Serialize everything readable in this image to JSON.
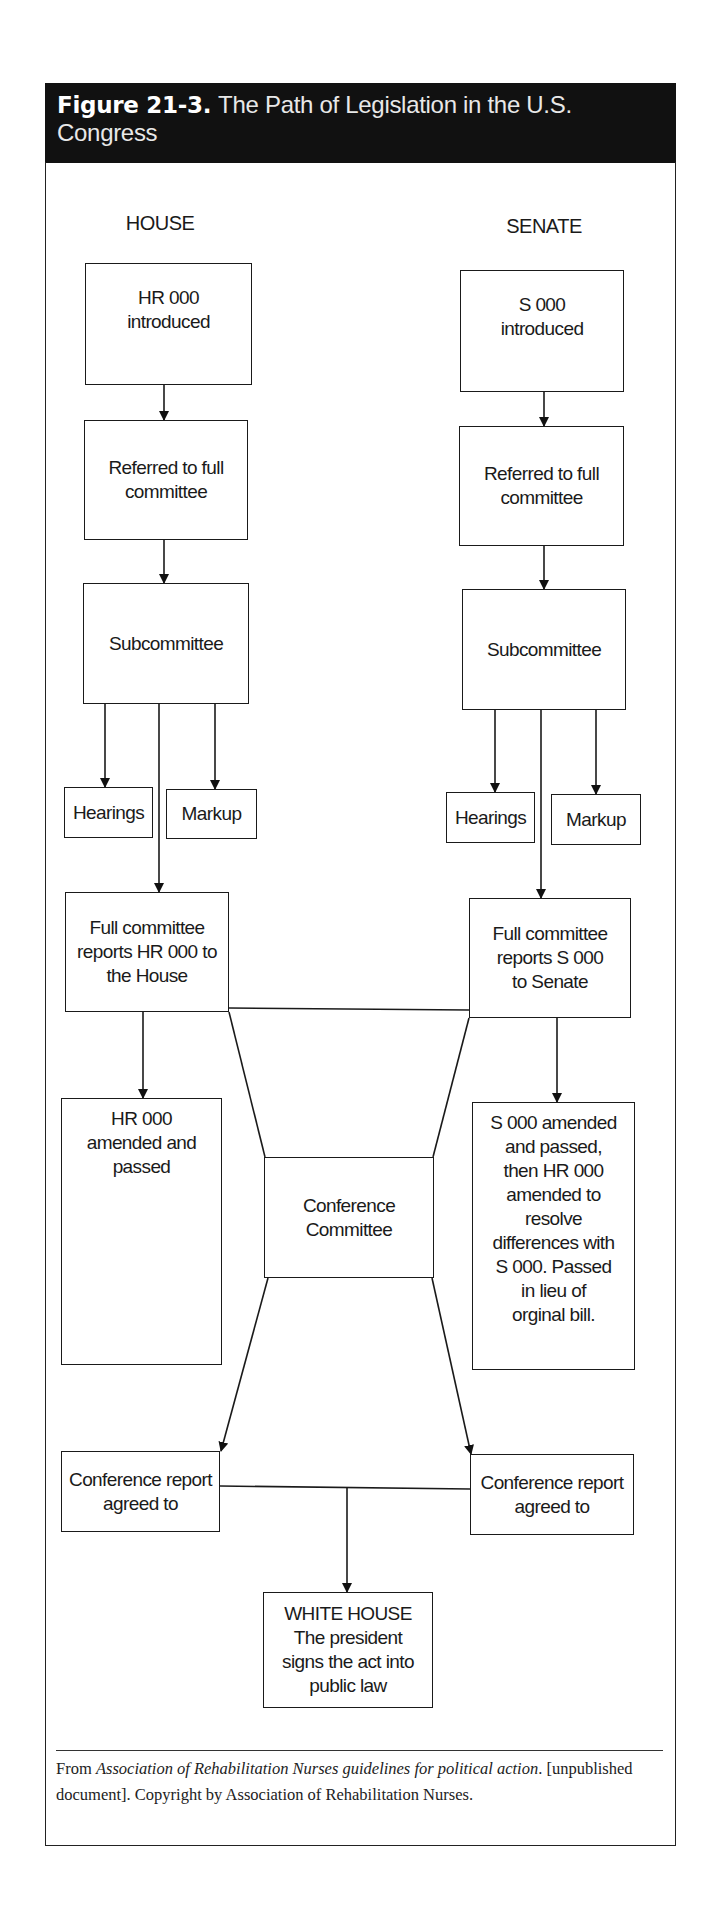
{
  "figure": {
    "number": "Figure 21-3.",
    "title": "The Path of Legislation in the U.S. Congress"
  },
  "chambers": {
    "house": "HOUSE",
    "senate": "SENATE"
  },
  "house": {
    "introduced": "HR 000\nintroduced",
    "referred": "Referred to full\ncommittee",
    "subcommittee": "Subcommittee",
    "hearings": "Hearings",
    "markup": "Markup",
    "full_committee": "Full committee\nreports HR 000 to\nthe House",
    "amended": "HR 000\namended and\npassed",
    "conference_report": "Conference report\nagreed to"
  },
  "senate": {
    "introduced": "S 000\nintroduced",
    "referred": "Referred to full\ncommittee",
    "subcommittee": "Subcommittee",
    "hearings": "Hearings",
    "markup": "Markup",
    "full_committee": "Full committee\nreports S 000\nto Senate",
    "amended": "S 000 amended\nand passed,\nthen HR 000\namended to\nresolve\ndifferences with\nS 000. Passed\nin lieu of\norginal bill.",
    "conference_report": "Conference report\nagreed to"
  },
  "conference_committee": "Conference\nCommittee",
  "white_house": "WHITE HOUSE\nThe president\nsigns the act into\npublic law",
  "source": {
    "prefix": "From ",
    "italic": "Association of Rehabilitation Nurses guidelines for political action",
    "suffix": ". [unpublished document]. Copyright by Association of Rehabilitation Nurses."
  },
  "colors": {
    "header_bg": "#111111",
    "line": "#1a1a1a"
  }
}
